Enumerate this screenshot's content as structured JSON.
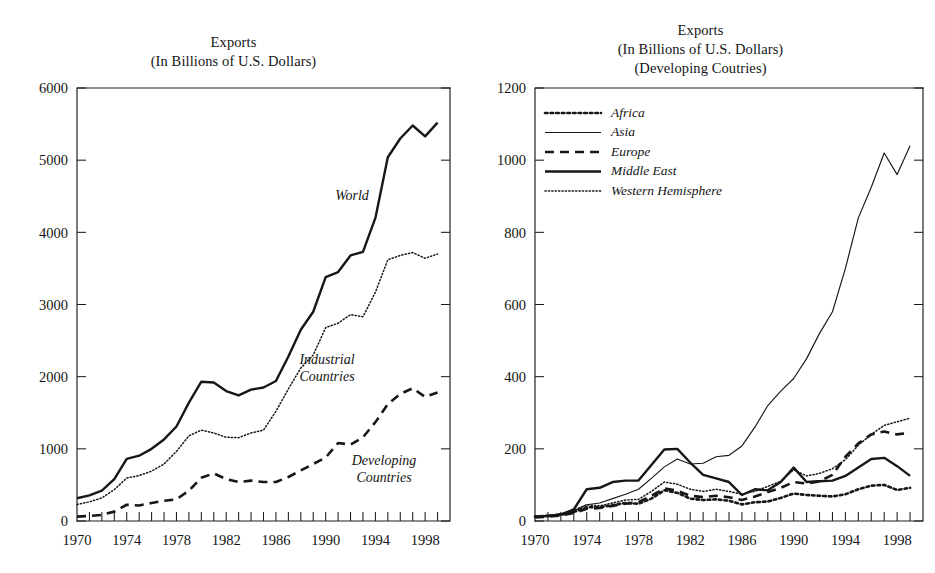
{
  "figure": {
    "background_color": "#ffffff",
    "ink_color": "#171717"
  },
  "panels": {
    "left": {
      "title_line1": "Exports",
      "title_line2": "(In Billions of U.S. Dollars)",
      "inline_labels": {
        "world": "World",
        "industrial_line1": "Industrial",
        "industrial_line2": "Countries",
        "developing_line1": "Developing",
        "developing_line2": "Countries"
      }
    },
    "right": {
      "title_line1": "Exports",
      "title_line2": "(In Billions of U.S. Dollars)",
      "title_line3": "(Developing Coutries)",
      "legend": [
        {
          "label": "Africa",
          "style": "dotted-coarse"
        },
        {
          "label": "Asia",
          "style": "solid-thin"
        },
        {
          "label": "Europe",
          "style": "dashed"
        },
        {
          "label": "Middle East",
          "style": "solid-thick"
        },
        {
          "label": "Western Hemisphere",
          "style": "dotted-fine"
        }
      ]
    }
  },
  "chart_data": [
    {
      "type": "line",
      "title": "Exports (In Billions of U.S. Dollars)",
      "xlabel": "",
      "ylabel": "",
      "xlim": [
        1970,
        2000
      ],
      "ylim": [
        0,
        6000
      ],
      "yticks": [
        0,
        1000,
        2000,
        3000,
        4000,
        5000,
        6000
      ],
      "ytick_labels": [
        "0",
        "1000",
        "2000",
        "3000",
        "4000",
        "5000",
        "6000"
      ],
      "xticks": [
        1970,
        1971,
        1972,
        1973,
        1974,
        1975,
        1976,
        1977,
        1978,
        1979,
        1980,
        1981,
        1982,
        1983,
        1984,
        1985,
        1986,
        1987,
        1988,
        1989,
        1990,
        1991,
        1992,
        1993,
        1994,
        1995,
        1996,
        1997,
        1998,
        1999,
        2000
      ],
      "xtick_labels": [
        "1970",
        "1974",
        "1978",
        "1982",
        "1986",
        "1990",
        "1994",
        "1998"
      ],
      "xtick_labeled_years": [
        1970,
        1974,
        1978,
        1982,
        1986,
        1990,
        1994,
        1998
      ],
      "grid": false,
      "legend_position": "inline-annotations",
      "x": [
        1970,
        1971,
        1972,
        1973,
        1974,
        1975,
        1976,
        1977,
        1978,
        1979,
        1980,
        1981,
        1982,
        1983,
        1984,
        1985,
        1986,
        1987,
        1988,
        1989,
        1990,
        1991,
        1992,
        1993,
        1994,
        1995,
        1996,
        1997,
        1998,
        1999
      ],
      "series": [
        {
          "name": "World",
          "style": "solid-thick",
          "values": [
            315,
            355,
            420,
            580,
            860,
            905,
            1000,
            1130,
            1310,
            1640,
            1930,
            1920,
            1800,
            1740,
            1820,
            1850,
            1940,
            2280,
            2650,
            2900,
            3380,
            3450,
            3680,
            3730,
            4200,
            5040,
            5300,
            5480,
            5330,
            5520
          ]
        },
        {
          "name": "Industrial Countries",
          "style": "dotted-fine",
          "values": [
            230,
            265,
            320,
            435,
            595,
            630,
            690,
            790,
            965,
            1180,
            1260,
            1220,
            1160,
            1155,
            1220,
            1260,
            1520,
            1830,
            2120,
            2300,
            2680,
            2740,
            2860,
            2830,
            3170,
            3620,
            3680,
            3720,
            3640,
            3700
          ]
        },
        {
          "name": "Developing Countries",
          "style": "dashed",
          "values": [
            60,
            70,
            85,
            130,
            225,
            215,
            250,
            280,
            300,
            420,
            600,
            660,
            580,
            540,
            560,
            540,
            540,
            610,
            700,
            790,
            880,
            1080,
            1060,
            1160,
            1370,
            1620,
            1760,
            1840,
            1720,
            1780
          ]
        }
      ]
    },
    {
      "type": "line",
      "title": "Exports (In Billions of U.S. Dollars) (Developing Coutries)",
      "xlabel": "",
      "ylabel": "",
      "xlim": [
        1970,
        2000
      ],
      "ylim": [
        0,
        1200
      ],
      "yticks": [
        0,
        200,
        400,
        600,
        800,
        1000,
        1200
      ],
      "ytick_labels": [
        "0",
        "200",
        "400",
        "600",
        "800",
        "1000",
        "1200"
      ],
      "xticks": [
        1970,
        1971,
        1972,
        1973,
        1974,
        1975,
        1976,
        1977,
        1978,
        1979,
        1980,
        1981,
        1982,
        1983,
        1984,
        1985,
        1986,
        1987,
        1988,
        1989,
        1990,
        1991,
        1992,
        1993,
        1994,
        1995,
        1996,
        1997,
        1998,
        1999,
        2000
      ],
      "xtick_labels": [
        "1970",
        "1974",
        "1978",
        "1982",
        "1986",
        "1990",
        "1994",
        "1998"
      ],
      "xtick_labeled_years": [
        1970,
        1974,
        1978,
        1982,
        1986,
        1990,
        1994,
        1998
      ],
      "grid": false,
      "legend_position": "upper-left-inside",
      "x": [
        1970,
        1971,
        1972,
        1973,
        1974,
        1975,
        1976,
        1977,
        1978,
        1979,
        1980,
        1981,
        1982,
        1983,
        1984,
        1985,
        1986,
        1987,
        1988,
        1989,
        1990,
        1991,
        1992,
        1993,
        1994,
        1995,
        1996,
        1997,
        1998,
        1999
      ],
      "series": [
        {
          "name": "Africa",
          "style": "dotted-coarse",
          "values": [
            12,
            14,
            17,
            25,
            38,
            38,
            44,
            50,
            48,
            62,
            85,
            78,
            62,
            58,
            60,
            56,
            46,
            52,
            54,
            64,
            76,
            72,
            70,
            68,
            74,
            88,
            98,
            100,
            86,
            92
          ]
        },
        {
          "name": "Asia",
          "style": "solid-thin",
          "values": [
            12,
            14,
            18,
            28,
            45,
            50,
            62,
            74,
            88,
            118,
            150,
            172,
            158,
            160,
            178,
            182,
            208,
            260,
            320,
            360,
            395,
            450,
            520,
            580,
            700,
            840,
            925,
            1020,
            960,
            1040
          ]
        },
        {
          "name": "Europe",
          "style": "dashed",
          "values": [
            10,
            12,
            15,
            22,
            34,
            36,
            42,
            48,
            52,
            70,
            90,
            84,
            70,
            66,
            70,
            66,
            58,
            68,
            80,
            92,
            108,
            104,
            110,
            128,
            178,
            215,
            240,
            248,
            240,
            245
          ]
        },
        {
          "name": "Middle East",
          "style": "solid-thick",
          "values": [
            12,
            14,
            18,
            32,
            88,
            92,
            108,
            112,
            112,
            155,
            198,
            200,
            162,
            128,
            118,
            108,
            72,
            88,
            85,
            108,
            148,
            108,
            110,
            112,
            125,
            148,
            172,
            175,
            152,
            125
          ]
        },
        {
          "name": "Western Hemisphere",
          "style": "dotted-fine",
          "values": [
            14,
            16,
            20,
            30,
            45,
            42,
            50,
            58,
            60,
            82,
            108,
            102,
            88,
            82,
            88,
            82,
            74,
            82,
            96,
            110,
            142,
            125,
            132,
            145,
            170,
            210,
            240,
            265,
            275,
            285
          ]
        }
      ]
    }
  ]
}
